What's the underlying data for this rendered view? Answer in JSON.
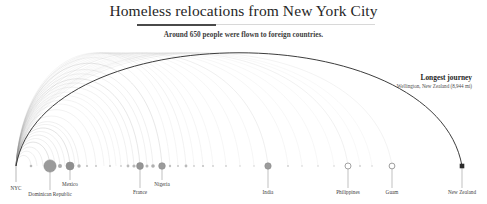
{
  "header": {
    "title": "Homeless relocations from New York City",
    "subtitle": "Around 650 people were flown to foreign countries."
  },
  "annotation": {
    "title": "Longest journey",
    "subtitle": "Wellington, New Zealand (8,944 mi)"
  },
  "chart_data": {
    "type": "arc-diagram",
    "title": "Homeless relocations from New York City",
    "subtitle": "Around 650 people were flown to foreign countries.",
    "total_people": 650,
    "origin": {
      "name": "NYC",
      "x": 16
    },
    "baseline_y": 166,
    "xlabel": "",
    "ylabel": "",
    "grid": false,
    "legend": false,
    "destinations": [
      {
        "name": "NYC",
        "x": 16,
        "r": 0,
        "labeled": true,
        "stem": 22,
        "fill": "none",
        "marker": "origin"
      },
      {
        "name": "",
        "x": 31,
        "r": 1.3,
        "labeled": false,
        "stem": 0,
        "fill": "#b9b9b9",
        "marker": "dot"
      },
      {
        "name": "Dominican Republic",
        "x": 50,
        "r": 6.1,
        "labeled": true,
        "stem": 24,
        "fill": "#9a9a9a",
        "marker": "circle"
      },
      {
        "name": "",
        "x": 60,
        "r": 2.0,
        "labeled": false,
        "stem": 0,
        "fill": "#adadad",
        "marker": "dot"
      },
      {
        "name": "Mexico",
        "x": 70,
        "r": 4.0,
        "labeled": true,
        "stem": 14,
        "fill": "#8f8f8f",
        "marker": "circle"
      },
      {
        "name": "",
        "x": 79,
        "r": 1.7,
        "labeled": false,
        "stem": 0,
        "fill": "#b3b3b3",
        "marker": "dot"
      },
      {
        "name": "",
        "x": 87,
        "r": 1.1,
        "labeled": false,
        "stem": 0,
        "fill": "#c2c2c2",
        "marker": "dot"
      },
      {
        "name": "",
        "x": 96,
        "r": 1.0,
        "labeled": false,
        "stem": 0,
        "fill": "#c6c6c6",
        "marker": "dot"
      },
      {
        "name": "",
        "x": 110,
        "r": 1.0,
        "labeled": false,
        "stem": 0,
        "fill": "#c6c6c6",
        "marker": "dot"
      },
      {
        "name": "",
        "x": 121,
        "r": 0.9,
        "labeled": false,
        "stem": 0,
        "fill": "#cccccc",
        "marker": "dot"
      },
      {
        "name": "",
        "x": 128,
        "r": 1.4,
        "labeled": false,
        "stem": 0,
        "fill": "#bcbcbc",
        "marker": "dot"
      },
      {
        "name": "",
        "x": 134,
        "r": 1.6,
        "labeled": false,
        "stem": 0,
        "fill": "#b6b6b6",
        "marker": "dot"
      },
      {
        "name": "France",
        "x": 140,
        "r": 3.4,
        "labeled": true,
        "stem": 22,
        "fill": "#959595",
        "marker": "circle"
      },
      {
        "name": "",
        "x": 147,
        "r": 1.5,
        "labeled": false,
        "stem": 0,
        "fill": "#b8b8b8",
        "marker": "dot"
      },
      {
        "name": "",
        "x": 153,
        "r": 1.8,
        "labeled": false,
        "stem": 0,
        "fill": "#b0b0b0",
        "marker": "dot"
      },
      {
        "name": "Nigeria",
        "x": 162,
        "r": 3.3,
        "labeled": true,
        "stem": 14,
        "fill": "#9b9b9b",
        "marker": "circle"
      },
      {
        "name": "",
        "x": 170,
        "r": 1.2,
        "labeled": false,
        "stem": 0,
        "fill": "#c0c0c0",
        "marker": "dot"
      },
      {
        "name": "",
        "x": 178,
        "r": 1.0,
        "labeled": false,
        "stem": 0,
        "fill": "#c6c6c6",
        "marker": "dot"
      },
      {
        "name": "",
        "x": 186,
        "r": 1.4,
        "labeled": false,
        "stem": 0,
        "fill": "#bababa",
        "marker": "dot"
      },
      {
        "name": "",
        "x": 194,
        "r": 0.9,
        "labeled": false,
        "stem": 0,
        "fill": "#cccccc",
        "marker": "dot"
      },
      {
        "name": "",
        "x": 203,
        "r": 1.1,
        "labeled": false,
        "stem": 0,
        "fill": "#c4c4c4",
        "marker": "dot"
      },
      {
        "name": "",
        "x": 213,
        "r": 0.9,
        "labeled": false,
        "stem": 0,
        "fill": "#cecece",
        "marker": "dot"
      },
      {
        "name": "",
        "x": 226,
        "r": 0.9,
        "labeled": false,
        "stem": 0,
        "fill": "#cecece",
        "marker": "dot"
      },
      {
        "name": "",
        "x": 240,
        "r": 0.8,
        "labeled": false,
        "stem": 0,
        "fill": "#d2d2d2",
        "marker": "dot"
      },
      {
        "name": "",
        "x": 254,
        "r": 0.8,
        "labeled": false,
        "stem": 0,
        "fill": "#d2d2d2",
        "marker": "dot"
      },
      {
        "name": "India",
        "x": 268,
        "r": 3.2,
        "labeled": true,
        "stem": 22,
        "fill": "#9c9c9c",
        "marker": "circle"
      },
      {
        "name": "",
        "x": 288,
        "r": 0.9,
        "labeled": false,
        "stem": 0,
        "fill": "#cecece",
        "marker": "dot"
      },
      {
        "name": "",
        "x": 302,
        "r": 0.8,
        "labeled": false,
        "stem": 0,
        "fill": "#d2d2d2",
        "marker": "dot"
      },
      {
        "name": "",
        "x": 318,
        "r": 0.8,
        "labeled": false,
        "stem": 0,
        "fill": "#d2d2d2",
        "marker": "dot"
      },
      {
        "name": "",
        "x": 334,
        "r": 0.8,
        "labeled": false,
        "stem": 0,
        "fill": "#d2d2d2",
        "marker": "dot"
      },
      {
        "name": "Philippines",
        "x": 348,
        "r": 3.0,
        "labeled": true,
        "stem": 22,
        "fill": "#a3a3a3",
        "marker": "ring"
      },
      {
        "name": "",
        "x": 360,
        "r": 0.9,
        "labeled": false,
        "stem": 0,
        "fill": "#cecece",
        "marker": "dot"
      },
      {
        "name": "",
        "x": 372,
        "r": 0.8,
        "labeled": false,
        "stem": 0,
        "fill": "#d2d2d2",
        "marker": "dot"
      },
      {
        "name": "Guam",
        "x": 392,
        "r": 2.9,
        "labeled": true,
        "stem": 22,
        "fill": "#ffffff",
        "marker": "ring"
      },
      {
        "name": "New Zealand",
        "x": 462,
        "r": 2.3,
        "labeled": true,
        "stem": 22,
        "fill": "#2b2b2b",
        "marker": "square"
      }
    ],
    "arcs": [
      {
        "to": 31,
        "opacity": 0.3,
        "width": 0.5
      },
      {
        "to": 37,
        "opacity": 0.26,
        "width": 0.5
      },
      {
        "to": 43,
        "opacity": 0.3,
        "width": 0.5
      },
      {
        "to": 50,
        "opacity": 0.42,
        "width": 0.6
      },
      {
        "to": 55,
        "opacity": 0.26,
        "width": 0.5
      },
      {
        "to": 60,
        "opacity": 0.32,
        "width": 0.5
      },
      {
        "to": 65,
        "opacity": 0.24,
        "width": 0.5
      },
      {
        "to": 70,
        "opacity": 0.4,
        "width": 0.6
      },
      {
        "to": 75,
        "opacity": 0.24,
        "width": 0.5
      },
      {
        "to": 79,
        "opacity": 0.28,
        "width": 0.5
      },
      {
        "to": 87,
        "opacity": 0.22,
        "width": 0.5
      },
      {
        "to": 96,
        "opacity": 0.22,
        "width": 0.5
      },
      {
        "to": 104,
        "opacity": 0.2,
        "width": 0.5
      },
      {
        "to": 110,
        "opacity": 0.22,
        "width": 0.5
      },
      {
        "to": 116,
        "opacity": 0.18,
        "width": 0.5
      },
      {
        "to": 121,
        "opacity": 0.2,
        "width": 0.5
      },
      {
        "to": 128,
        "opacity": 0.24,
        "width": 0.5
      },
      {
        "to": 134,
        "opacity": 0.26,
        "width": 0.5
      },
      {
        "to": 140,
        "opacity": 0.34,
        "width": 0.6
      },
      {
        "to": 147,
        "opacity": 0.24,
        "width": 0.5
      },
      {
        "to": 153,
        "opacity": 0.26,
        "width": 0.5
      },
      {
        "to": 162,
        "opacity": 0.34,
        "width": 0.6
      },
      {
        "to": 170,
        "opacity": 0.2,
        "width": 0.5
      },
      {
        "to": 178,
        "opacity": 0.18,
        "width": 0.5
      },
      {
        "to": 186,
        "opacity": 0.22,
        "width": 0.5
      },
      {
        "to": 194,
        "opacity": 0.17,
        "width": 0.5
      },
      {
        "to": 203,
        "opacity": 0.19,
        "width": 0.5
      },
      {
        "to": 213,
        "opacity": 0.17,
        "width": 0.5
      },
      {
        "to": 226,
        "opacity": 0.16,
        "width": 0.5
      },
      {
        "to": 240,
        "opacity": 0.15,
        "width": 0.5
      },
      {
        "to": 254,
        "opacity": 0.15,
        "width": 0.5
      },
      {
        "to": 268,
        "opacity": 0.26,
        "width": 0.55
      },
      {
        "to": 288,
        "opacity": 0.15,
        "width": 0.5
      },
      {
        "to": 302,
        "opacity": 0.14,
        "width": 0.5
      },
      {
        "to": 318,
        "opacity": 0.14,
        "width": 0.5
      },
      {
        "to": 334,
        "opacity": 0.13,
        "width": 0.5
      },
      {
        "to": 348,
        "opacity": 0.22,
        "width": 0.55
      },
      {
        "to": 360,
        "opacity": 0.13,
        "width": 0.5
      },
      {
        "to": 372,
        "opacity": 0.13,
        "width": 0.5
      },
      {
        "to": 392,
        "opacity": 0.2,
        "width": 0.55
      },
      {
        "to": 462,
        "opacity": 0.95,
        "width": 1.0
      }
    ]
  }
}
